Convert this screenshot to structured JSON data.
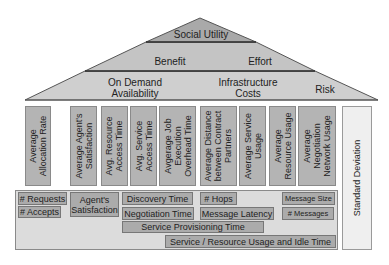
{
  "pyramid": {
    "tier1": {
      "label": "Social Utility"
    },
    "tier2": {
      "left_label": "Benefit",
      "right_label": "Effort"
    },
    "tier3": {
      "left_label_line1": "On Demand",
      "left_label_line2": "Availability",
      "mid_label_line1": "Infrastructure",
      "mid_label_line2": "Costs",
      "right_label": "Risk"
    }
  },
  "columns": [
    {
      "line1": "Average",
      "line2": "Allocation   Rate"
    },
    {
      "line1": "Average Agent's",
      "line2": "Satisfaction"
    },
    {
      "line1": "Avg. Resource",
      "line2": "Access Time"
    },
    {
      "line1": "Avg. Service",
      "line2": "Access Time"
    },
    {
      "line1": "Avgerage  Job",
      "line2": "Execution",
      "line3": "Overhead Time"
    },
    {
      "line1": "Average Distance",
      "line2": "between Contract",
      "line3": "Partners"
    },
    {
      "line1": "Average Service",
      "line2": "Usage"
    },
    {
      "line1": "Average",
      "line2": "Resource Usage"
    },
    {
      "line1": "Average",
      "line2": "Negotiation",
      "line3": "Network Usage"
    }
  ],
  "side_column": {
    "label": "Standard Deviation"
  },
  "base_metrics": {
    "requests": "# Requests",
    "accepts": "# Accepts",
    "agents_satisfaction_line1": "Agent's",
    "agents_satisfaction_line2": "Satisfaction",
    "discovery_time": "Discovery Time",
    "negotiation_time": "Negotiation Time",
    "hops": "# Hops",
    "message_latency": "Message Latency",
    "message_size": "Message Size",
    "messages": "# Messages",
    "service_provisioning_time": "Service Provisioning Time",
    "service_resource_usage": "Service / Resource Usage and Idle Time"
  },
  "colors": {
    "tier_fill": "#c8c8c8",
    "tier_top_fill": "#aaaaaa",
    "column_fill": "#b4b4b4",
    "base_fill": "#dcdcdc",
    "chip_fill": "#ababab",
    "std_dev_fill": "#efefef"
  }
}
